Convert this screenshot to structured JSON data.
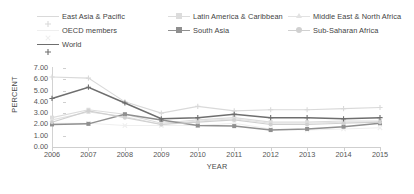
{
  "legend": {
    "items": [
      {
        "label": "East Asia & Pacific",
        "color": "#d9d9d9",
        "marker": "plus",
        "x": 37,
        "y": 6
      },
      {
        "label": "Latin America & Caribbean",
        "color": "#dcdcdc",
        "marker": "square",
        "x": 168,
        "y": 6
      },
      {
        "label": "Middle East & North Africa",
        "color": "#e2e2e2",
        "marker": "triangle",
        "x": 288,
        "y": 6
      },
      {
        "label": "OECD members",
        "color": "#efefef",
        "marker": "cross",
        "x": 37,
        "y": 20
      },
      {
        "label": "South Asia",
        "color": "#8f8f8f",
        "marker": "square",
        "x": 168,
        "y": 20
      },
      {
        "label": "Sub-Saharan Africa",
        "color": "#d0d0d0",
        "marker": "circle",
        "x": 288,
        "y": 20
      },
      {
        "label": "World",
        "color": "#6e6e6e",
        "marker": "plus",
        "x": 37,
        "y": 34
      }
    ]
  },
  "axes": {
    "ylabel": "PERCENT",
    "xlabel": "YEAR",
    "yticks": [
      "0.00",
      "1.00",
      "2.00",
      "3.00",
      "4.00",
      "5.00",
      "6.00",
      "7.00"
    ],
    "ytick_values": [
      0,
      1,
      2,
      3,
      4,
      5,
      6,
      7
    ],
    "xticks": [
      "2006",
      "2007",
      "2008",
      "2009",
      "2010",
      "2011",
      "2012",
      "2013",
      "2014",
      "2015"
    ]
  },
  "chart_data": {
    "type": "line",
    "title": "",
    "xlabel": "YEAR",
    "ylabel": "PERCENT",
    "x": [
      2006,
      2007,
      2008,
      2009,
      2010,
      2011,
      2012,
      2013,
      2014,
      2015
    ],
    "ylim": [
      0,
      7
    ],
    "xlim": [
      2006,
      2015
    ],
    "grid": false,
    "legend_position": "top",
    "series": [
      {
        "name": "East Asia & Pacific",
        "color": "#d9d9d9",
        "marker": "plus",
        "values": [
          6.2,
          6.1,
          4.0,
          3.0,
          3.6,
          3.2,
          3.3,
          3.3,
          3.4,
          3.5
        ]
      },
      {
        "name": "Latin America & Caribbean",
        "color": "#dcdcdc",
        "marker": "square",
        "values": [
          2.6,
          3.3,
          2.9,
          2.1,
          2.4,
          2.6,
          2.2,
          2.2,
          2.3,
          2.3
        ]
      },
      {
        "name": "Middle East & North Africa",
        "color": "#e2e2e2",
        "marker": "triangle",
        "values": [
          2.4,
          3.1,
          2.7,
          2.0,
          2.3,
          2.5,
          2.1,
          2.1,
          2.2,
          2.2
        ]
      },
      {
        "name": "OECD members",
        "color": "#efefef",
        "marker": "cross",
        "values": [
          2.1,
          2.1,
          1.9,
          1.9,
          1.9,
          2.1,
          1.6,
          1.5,
          1.6,
          1.7
        ]
      },
      {
        "name": "South Asia",
        "color": "#8f8f8f",
        "marker": "square",
        "values": [
          2.0,
          2.05,
          2.9,
          2.4,
          1.9,
          1.85,
          1.5,
          1.6,
          1.8,
          2.1
        ]
      },
      {
        "name": "Sub-Saharan Africa",
        "color": "#d0d0d0",
        "marker": "circle",
        "values": [
          2.2,
          3.2,
          2.6,
          2.0,
          2.2,
          2.4,
          2.0,
          2.0,
          2.1,
          2.2
        ]
      },
      {
        "name": "World",
        "color": "#6e6e6e",
        "marker": "plus",
        "values": [
          4.3,
          5.3,
          3.9,
          2.5,
          2.6,
          2.9,
          2.6,
          2.6,
          2.5,
          2.6
        ]
      }
    ]
  }
}
